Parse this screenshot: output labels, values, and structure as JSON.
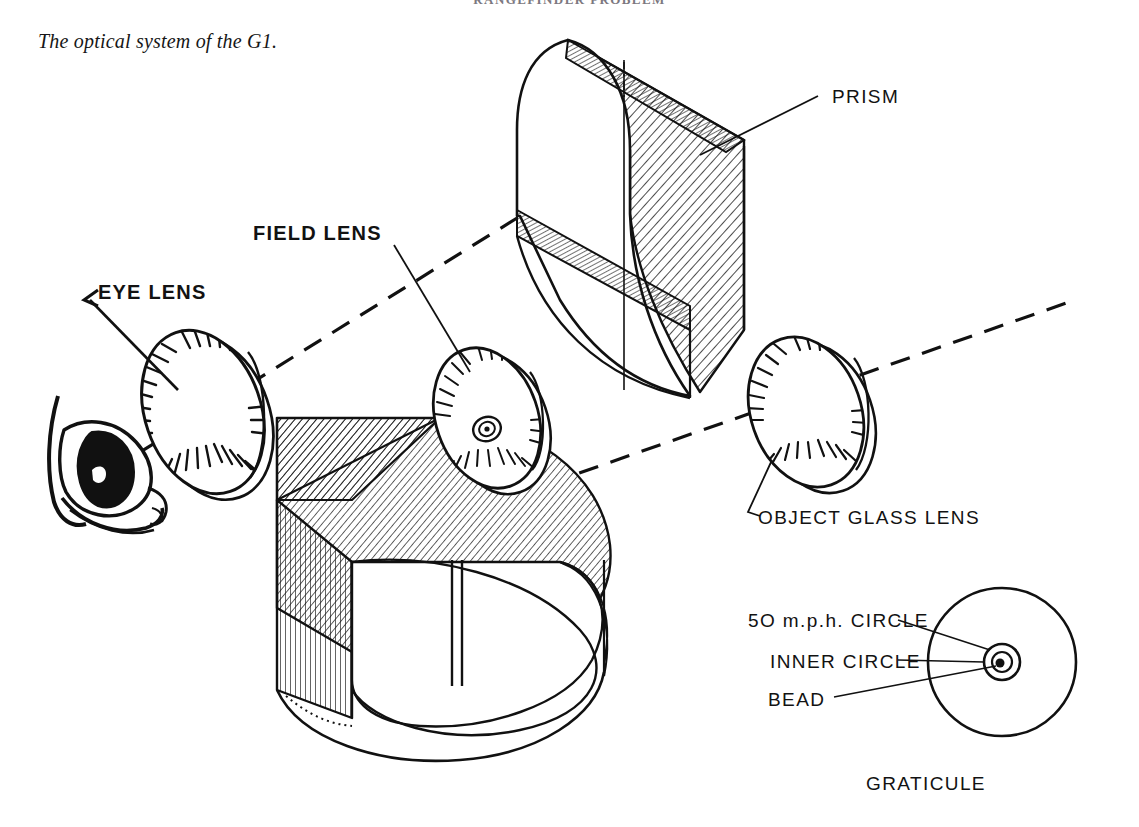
{
  "page": {
    "running_header": "RANGEFINDER PROBLEM",
    "background_color": "#ffffff",
    "ink_color": "#111111",
    "width": 1139,
    "height": 827
  },
  "caption": {
    "text": "The optical system of the G1."
  },
  "figure": {
    "labels": {
      "eye_lens": "EYE LENS",
      "field_lens": "FIELD LENS",
      "prism": "PRISM",
      "object_glass_lens": "OBJECT GLASS LENS"
    },
    "graticule": {
      "caption": "GRATICULE",
      "callouts": [
        {
          "id": "mph-circle",
          "text": "5O m.p.h. CIRCLE"
        },
        {
          "id": "inner-circle",
          "text": "INNER CIRCLE"
        },
        {
          "id": "bead",
          "text": "BEAD"
        }
      ]
    },
    "components": [
      {
        "id": "eye",
        "name": "human eye"
      },
      {
        "id": "eye-lens",
        "name": "eye lens"
      },
      {
        "id": "lower-prism",
        "name": "lower prism block"
      },
      {
        "id": "field-lens",
        "name": "field lens"
      },
      {
        "id": "upper-prism",
        "name": "upper prism block"
      },
      {
        "id": "object-glass-lens",
        "name": "object glass lens"
      },
      {
        "id": "graticule",
        "name": "graticule reticle"
      }
    ],
    "optical_axes": [
      {
        "id": "eye-axis",
        "description": "dashed axis from eye through eye lens to upper prism"
      },
      {
        "id": "object-axis",
        "description": "dashed axis from object glass lens through lower prism"
      }
    ]
  }
}
